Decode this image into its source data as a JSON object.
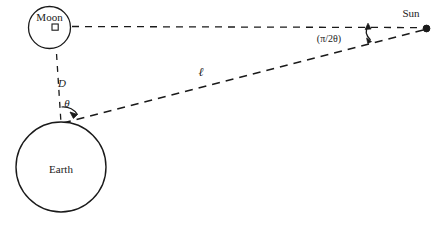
{
  "figure": {
    "type": "geometry-diagram",
    "background_color": "#ffffff",
    "stroke_color": "#1a1a1a"
  },
  "bodies": {
    "moon": {
      "label": "Moon",
      "shape": "circle",
      "cx": 49.5,
      "cy": 27.5,
      "r": 21,
      "label_x": 49.5,
      "label_y": 18
    },
    "earth": {
      "label": "Earth",
      "shape": "circle",
      "cx": 61,
      "cy": 167,
      "r": 45,
      "label_x": 61,
      "label_y": 170
    },
    "sun": {
      "label": "Sun",
      "shape": "dot",
      "cx": 427,
      "cy": 28.5,
      "r": 3.2,
      "label_x": 411,
      "label_y": 14
    }
  },
  "lines": {
    "moon_to_sun": {
      "name": "moon-sun-line",
      "x1": 72,
      "y1": 26.5,
      "x2": 425,
      "y2": 27.5,
      "style": "dashed"
    },
    "earth_to_moon": {
      "name": "earth-moon-line",
      "x1": 55,
      "y1": 29,
      "x2": 61,
      "y2": 124,
      "style": "dashed",
      "measure_label": "D"
    },
    "earth_to_sun": {
      "name": "earth-sun-line",
      "x1": 63,
      "y1": 123,
      "x2": 426,
      "y2": 29,
      "style": "dashed",
      "measure_label": "ℓ"
    }
  },
  "labels": {
    "distance_D": {
      "text": "D",
      "x": 62,
      "y": 84
    },
    "length_l": {
      "text": "ℓ",
      "x": 201,
      "y": 74
    },
    "theta_earth": {
      "text": "θ",
      "x": 67,
      "y": 105
    },
    "angle_sun": {
      "text": "(π/2θ)",
      "x": 329,
      "y": 40
    }
  },
  "markers": {
    "right_angle_moon": {
      "name": "right-angle-marker",
      "x": 52,
      "y": 24,
      "size": 6
    },
    "theta_arc": {
      "name": "theta-angle-arc",
      "cx": 61,
      "cy": 124,
      "radius": 19
    },
    "sun_angle_arrow": {
      "name": "sun-angle-arrow",
      "x": 368,
      "y_top": 24,
      "y_bottom": 40
    }
  }
}
